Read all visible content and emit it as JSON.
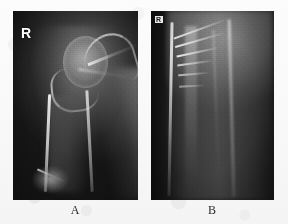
{
  "figure": {
    "background_color": "#fbfbfb",
    "panel_count": 2
  },
  "panels": [
    {
      "id": "A",
      "caption": "A",
      "side_marker": "R",
      "marker_position": "top-left",
      "film_background_color": "#1d1d1d",
      "bone_color": "#f2f2f2",
      "view": "anteroposterior shoulder and humerus radiograph",
      "anatomy": [
        "humeral head",
        "glenoid",
        "scapular spine",
        "surgical neck",
        "humeral shaft",
        "distal humerus"
      ]
    },
    {
      "id": "B",
      "caption": "B",
      "side_marker": "R",
      "marker_position": "top-left",
      "film_background_color": "#1a1a1a",
      "bone_color": "#fcfcfc",
      "view": "magnified humeral shaft radiograph",
      "anatomy": [
        "medial cortex",
        "lateral cortex",
        "medullary canal",
        "oblique periosteal striations"
      ]
    }
  ]
}
